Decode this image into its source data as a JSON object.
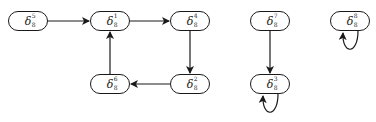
{
  "diagram": {
    "type": "state-transition-graph",
    "nodes": [
      {
        "id": "n5",
        "symbol": "δ",
        "sub": "8",
        "sup": "5",
        "x": 8,
        "y": 11
      },
      {
        "id": "n1",
        "symbol": "δ",
        "sub": "8",
        "sup": "1",
        "x": 90,
        "y": 11
      },
      {
        "id": "n4",
        "symbol": "δ",
        "sub": "8",
        "sup": "4",
        "x": 170,
        "y": 11
      },
      {
        "id": "n6",
        "symbol": "δ",
        "sub": "8",
        "sup": "6",
        "x": 90,
        "y": 74
      },
      {
        "id": "n2",
        "symbol": "δ",
        "sub": "8",
        "sup": "2",
        "x": 170,
        "y": 74
      },
      {
        "id": "n7",
        "symbol": "δ",
        "sub": "8",
        "sup": "7",
        "x": 250,
        "y": 11
      },
      {
        "id": "n3",
        "symbol": "δ",
        "sub": "8",
        "sup": "3",
        "x": 250,
        "y": 74
      },
      {
        "id": "n8",
        "symbol": "δ",
        "sub": "8",
        "sup": "8",
        "x": 330,
        "y": 11
      }
    ],
    "edges": [
      {
        "from": "n5",
        "to": "n1"
      },
      {
        "from": "n1",
        "to": "n4"
      },
      {
        "from": "n4",
        "to": "n2"
      },
      {
        "from": "n2",
        "to": "n6"
      },
      {
        "from": "n6",
        "to": "n1"
      },
      {
        "from": "n7",
        "to": "n3"
      },
      {
        "from": "n3",
        "to": "n3",
        "self_loop": true
      },
      {
        "from": "n8",
        "to": "n8",
        "self_loop": true
      }
    ],
    "colors": {
      "stroke": "#1a1a1a",
      "background": "#ffffff"
    }
  }
}
